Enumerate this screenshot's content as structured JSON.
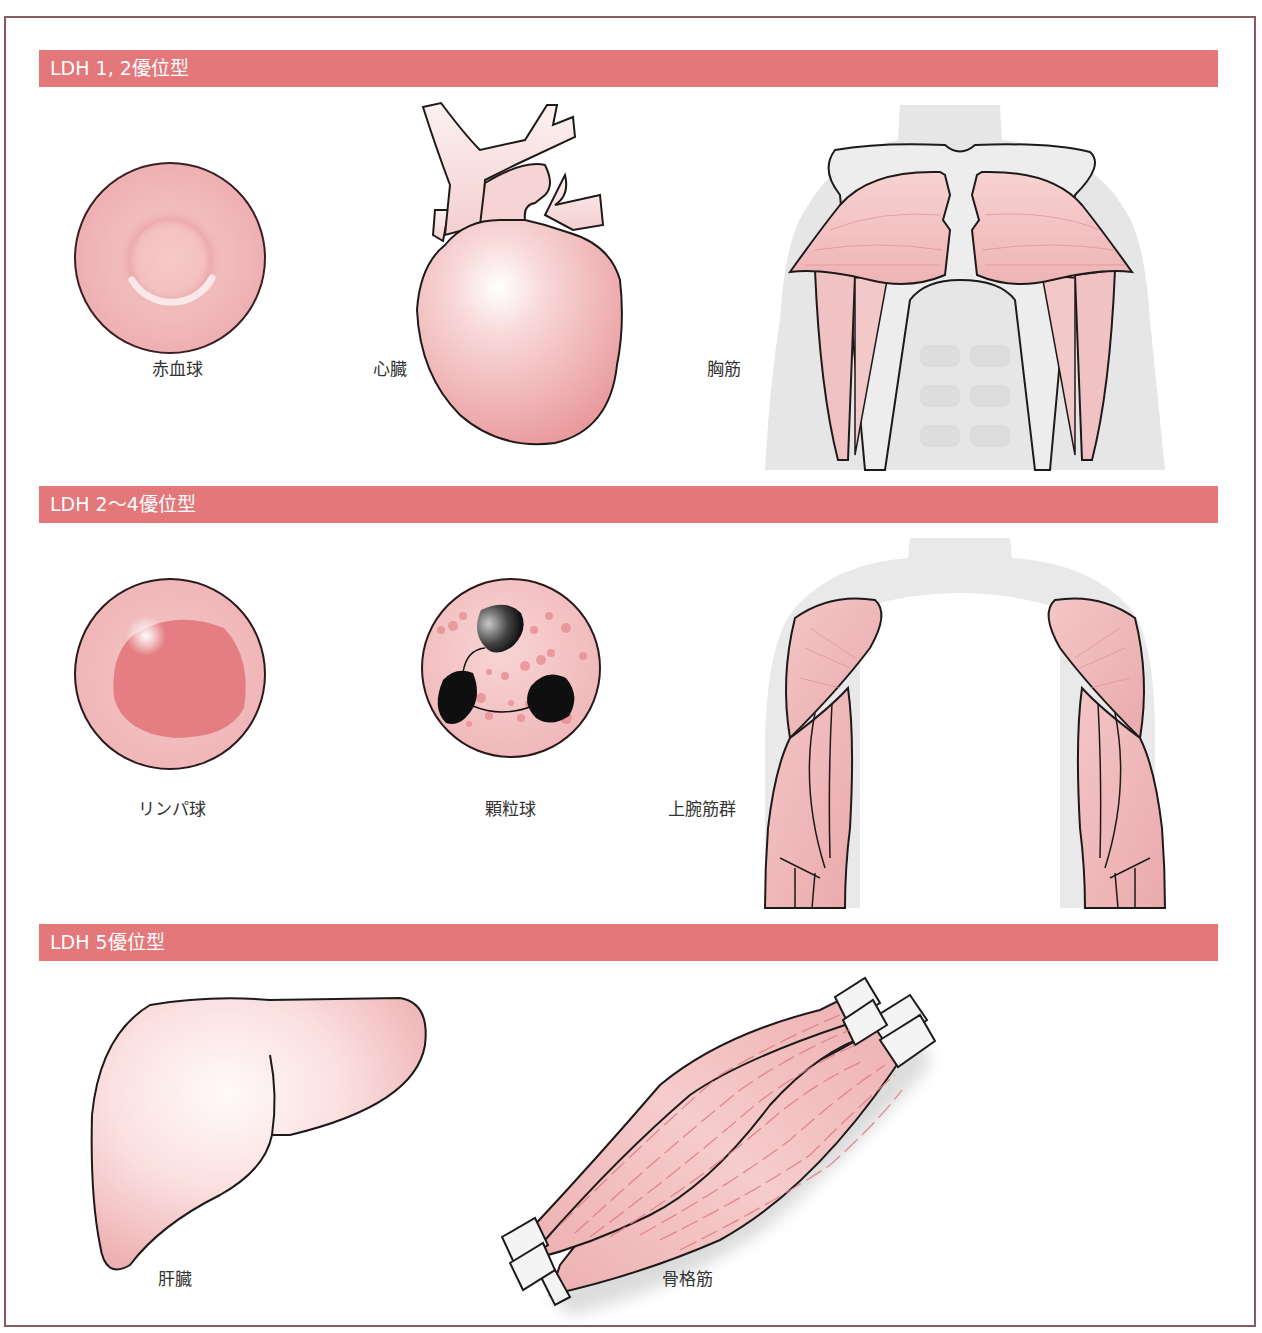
{
  "sections": [
    {
      "title": "LDH 1, 2優位型",
      "items": [
        {
          "label": "赤血球",
          "illustration": "red-blood-cell"
        },
        {
          "label": "心臓",
          "illustration": "heart"
        },
        {
          "label": "胸筋",
          "illustration": "chest-muscles"
        }
      ]
    },
    {
      "title": "LDH 2〜4優位型",
      "items": [
        {
          "label": "リンパ球",
          "illustration": "lymphocyte"
        },
        {
          "label": "顆粒球",
          "illustration": "granulocyte"
        },
        {
          "label": "上腕筋群",
          "illustration": "upper-arm-muscles"
        }
      ]
    },
    {
      "title": "LDH 5優位型",
      "items": [
        {
          "label": "肝臓",
          "illustration": "liver"
        },
        {
          "label": "骨格筋",
          "illustration": "skeletal-muscle"
        }
      ]
    }
  ],
  "colors": {
    "banner": "#e3777a",
    "banner_text": "#ffffff",
    "frame": "#8a5a62",
    "tissue_pink": "#f2b8b8",
    "tissue_light": "#fbe3e3",
    "body_gray": "#e4e4e4",
    "outline": "#1e1a1a",
    "label_text": "#333333"
  }
}
